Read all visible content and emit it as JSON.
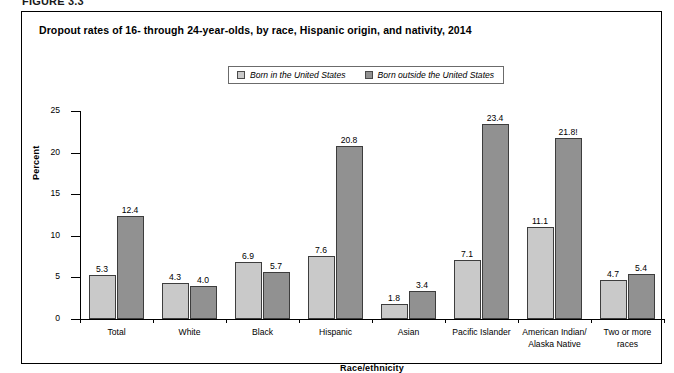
{
  "figure": {
    "label": "FIGURE 3.3",
    "title": "Dropout rates of 16- through 24-year-olds, by race, Hispanic origin, and nativity, 2014"
  },
  "legend": {
    "items": [
      {
        "label": "Born in the United States",
        "color": "#c9c9c9"
      },
      {
        "label": "Born outside the United States",
        "color": "#919191"
      }
    ]
  },
  "axes": {
    "y_label": "Percent",
    "x_label": "Race/ethnicity",
    "y_ticks": [
      "25",
      "20",
      "15",
      "10",
      "5",
      "0"
    ]
  },
  "chart_data": {
    "type": "bar",
    "title": "Dropout rates of 16- through 24-year-olds, by race, Hispanic origin, and nativity, 2014",
    "xlabel": "Race/ethnicity",
    "ylabel": "Percent",
    "ylim": [
      0,
      25
    ],
    "ytick_values": [
      0,
      5,
      10,
      15,
      20,
      25
    ],
    "grid": false,
    "legend_position": "top-center",
    "categories": [
      "Total",
      "White",
      "Black",
      "Hispanic",
      "Asian",
      "Pacific Islander",
      "American Indian/\nAlaska Native",
      "Two or more\nraces"
    ],
    "series": [
      {
        "name": "Born in the United States",
        "color": "#c9c9c9",
        "values": [
          5.3,
          4.3,
          6.9,
          7.6,
          1.8,
          7.1,
          11.1,
          4.7
        ],
        "labels": [
          "5.3",
          "4.3",
          "6.9",
          "7.6",
          "1.8",
          "7.1",
          "11.1",
          "4.7"
        ]
      },
      {
        "name": "Born outside the United States",
        "color": "#919191",
        "values": [
          12.4,
          4.0,
          5.7,
          20.8,
          3.4,
          23.4,
          21.8,
          5.4
        ],
        "labels": [
          "12.4",
          "4.0",
          "5.7",
          "20.8",
          "3.4",
          "23.4",
          "21.8!",
          "5.4"
        ]
      }
    ]
  }
}
